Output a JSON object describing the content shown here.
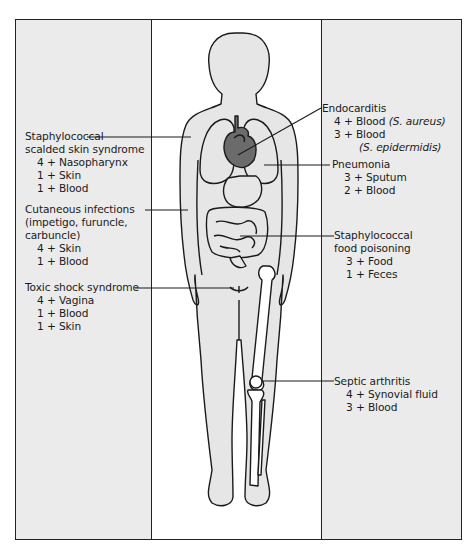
{
  "diagram": {
    "colors": {
      "panel": "#ebebeb",
      "body_fill": "#e6e6e6",
      "heart": "#6b6b6b",
      "line": "#1a1a1a"
    },
    "left_labels": [
      {
        "name": "Staphylococcal scalded skin syndrome",
        "title_lines": [
          "Staphylococcal",
          "scalded skin syndrome"
        ],
        "sites": [
          "4 + Nasopharynx",
          "1 + Skin",
          "1 + Blood"
        ]
      },
      {
        "name": "Cutaneous infections",
        "title_lines": [
          "Cutaneous infections",
          "(impetigo, furuncle,",
          "carbuncle)"
        ],
        "sites": [
          "4 + Skin",
          "1 + Blood"
        ]
      },
      {
        "name": "Toxic shock syndrome",
        "title_lines": [
          "Toxic shock syndrome"
        ],
        "sites": [
          "4 + Vagina",
          "1 + Blood",
          "1 + Skin"
        ]
      }
    ],
    "right_labels": [
      {
        "name": "Endocarditis",
        "title_lines": [
          "Endocarditis"
        ],
        "sites": [
          "4 + Blood",
          "3 + Blood"
        ],
        "organisms": [
          "(S. aureus)",
          "(S. epidermidis)"
        ]
      },
      {
        "name": "Pneumonia",
        "title_lines": [
          "Pneumonia"
        ],
        "sites": [
          "3 + Sputum",
          "2 + Blood"
        ]
      },
      {
        "name": "Staphylococcal food poisoning",
        "title_lines": [
          "Staphylococcal",
          "food poisoning"
        ],
        "sites": [
          "3 + Food",
          "1 + Feces"
        ]
      },
      {
        "name": "Septic arthritis",
        "title_lines": [
          "Septic arthritis"
        ],
        "sites": [
          "4 + Synovial fluid",
          "3 + Blood"
        ]
      }
    ]
  }
}
